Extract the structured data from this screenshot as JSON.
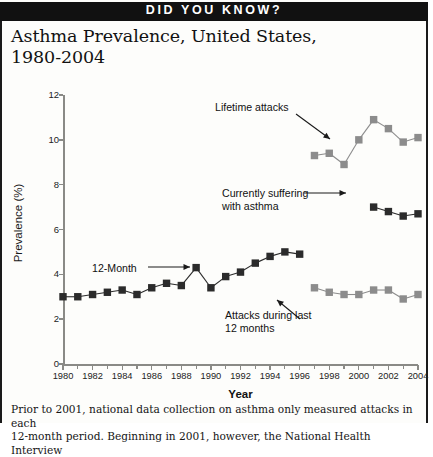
{
  "banner": {
    "text": "DID YOU KNOW?"
  },
  "title": {
    "line1": "Asthma Prevalence, United States,",
    "line2": "1980-2004"
  },
  "footnote": {
    "line1": "Prior to 2001, national data collection on asthma only measured attacks in each",
    "line2": "12-month period. Beginning in 2001, however, the National Health Interview"
  },
  "colors": {
    "dark_series": "#2b2b2b",
    "gray_series": "#8c8c8c",
    "axis": "#8a8a86",
    "banner_bg": "#111111",
    "banner_text": "#ffffff"
  },
  "annotations": {
    "twelve_month": "12-Month",
    "lifetime_attacks": "Lifetime attacks",
    "currently_suffering": "Currently suffering\nwith asthma",
    "attacks_last_12": "Attacks during last\n12 months"
  },
  "chart_data": {
    "type": "line",
    "title": "Asthma Prevalence, United States, 1980-2004",
    "xlabel": "Year",
    "ylabel": "Prevalence (%)",
    "xlim": [
      1980,
      2004
    ],
    "ylim": [
      0,
      12
    ],
    "ytick_labels": [
      "0",
      "2",
      "4",
      "6",
      "8",
      "10",
      "12"
    ],
    "ytick_values": [
      0,
      2,
      4,
      6,
      8,
      10,
      12
    ],
    "xtick_labels": [
      "1980",
      "1982",
      "1984",
      "1986",
      "1988",
      "1990",
      "1992",
      "1994",
      "1996",
      "1998",
      "2000",
      "2002",
      "2004"
    ],
    "xtick_values": [
      1980,
      1982,
      1984,
      1986,
      1988,
      1990,
      1992,
      1994,
      1996,
      1998,
      2000,
      2002,
      2004
    ],
    "minor_xticks": [
      1981,
      1983,
      1985,
      1987,
      1989,
      1991,
      1993,
      1995,
      1997,
      1999,
      2001,
      2003
    ],
    "grid": false,
    "legend_position": "inline-annotations",
    "series": [
      {
        "name": "12-Month",
        "color": "#2b2b2b",
        "marker": "square",
        "x": [
          1980,
          1981,
          1982,
          1983,
          1984,
          1985,
          1986,
          1987,
          1988,
          1989,
          1990,
          1991,
          1992,
          1993,
          1994,
          1995,
          1996
        ],
        "values": [
          3.0,
          3.0,
          3.1,
          3.2,
          3.3,
          3.1,
          3.4,
          3.6,
          3.5,
          4.3,
          3.4,
          3.9,
          4.1,
          4.5,
          4.8,
          5.0,
          4.9
        ]
      },
      {
        "name": "Lifetime attacks",
        "color": "#8c8c8c",
        "marker": "square",
        "x": [
          1997,
          1998,
          1999,
          2000,
          2001,
          2002,
          2003,
          2004
        ],
        "values": [
          9.3,
          9.4,
          8.9,
          10.0,
          10.9,
          10.5,
          9.9,
          10.1
        ]
      },
      {
        "name": "Currently suffering with asthma",
        "color": "#2b2b2b",
        "marker": "square",
        "x": [
          2001,
          2002,
          2003,
          2004
        ],
        "values": [
          7.0,
          6.8,
          6.6,
          6.7
        ]
      },
      {
        "name": "Attacks during last 12 months",
        "color": "#8c8c8c",
        "marker": "square",
        "x": [
          1997,
          1998,
          1999,
          2000,
          2001,
          2002,
          2003,
          2004
        ],
        "values": [
          3.4,
          3.2,
          3.1,
          3.1,
          3.3,
          3.3,
          2.9,
          3.1
        ]
      }
    ]
  }
}
